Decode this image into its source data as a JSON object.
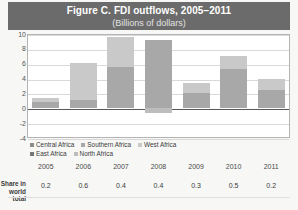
{
  "title": {
    "main": "Figure C. FDI outflows, 2005–2011",
    "sub": "(Billions of dollars)"
  },
  "colors": {
    "band": "#6b6b6b",
    "central_africa": "#8c8c8c",
    "southern_africa": "#a8a8a8",
    "west_africa": "#c9c9c9",
    "east_africa": "#767676",
    "north_africa": "#bdbdbd",
    "gridline": "#d9d9d9",
    "zeroline": "#5a5a5a",
    "plot_background": "#ffffff",
    "page_background": "#f7f7f5"
  },
  "legend": {
    "position": "below-plot",
    "rows": [
      [
        "Central Africa",
        "Southern Africa",
        "West Africa"
      ],
      [
        "East Africa",
        "North Africa"
      ]
    ],
    "entries": [
      {
        "label": "Central Africa",
        "color": "#8c8c8c"
      },
      {
        "label": "Southern Africa",
        "color": "#a8a8a8"
      },
      {
        "label": "West Africa",
        "color": "#c9c9c9"
      },
      {
        "label": "East Africa",
        "color": "#767676"
      },
      {
        "label": "North Africa",
        "color": "#bdbdbd"
      }
    ]
  },
  "share_row": {
    "label_line1": "Share in",
    "label_line2": "world total",
    "values": [
      "0.2",
      "0.6",
      "0.4",
      "0.4",
      "0.3",
      "0.5",
      "0.2"
    ]
  },
  "yaxis": {
    "ticks": [
      "10",
      "8",
      "6",
      "4",
      "2",
      "0",
      "-2",
      "-4"
    ],
    "min": -4,
    "max": 10,
    "step": 2
  },
  "chart_data": {
    "type": "bar",
    "title": "Figure C. FDI outflows, 2005–2011",
    "subtitle": "(Billions of dollars)",
    "xlabel": "",
    "ylabel": "Billions of dollars",
    "ylim": [
      -4,
      10
    ],
    "ytick_step": 2,
    "grid": true,
    "stacked": true,
    "legend_position": "below-plot",
    "categories": [
      "2005",
      "2006",
      "2007",
      "2008",
      "2009",
      "2010",
      "2011"
    ],
    "series": [
      {
        "name": "Central Africa",
        "color": "#8c8c8c",
        "values": [
          0.1,
          0.1,
          0.1,
          0.1,
          0.1,
          0.1,
          0.1
        ]
      },
      {
        "name": "Southern Africa",
        "color": "#a8a8a8",
        "values": [
          0.7,
          4.9,
          5.0,
          7.4,
          1.5,
          4.3,
          2.8
        ]
      },
      {
        "name": "West Africa",
        "color": "#c9c9c9",
        "values": [
          0.2,
          0.2,
          4.0,
          0.5,
          0.6,
          2.0,
          0.5
        ]
      },
      {
        "name": "East Africa",
        "color": "#767676",
        "values": [
          0.1,
          0.1,
          0.1,
          0.1,
          0.1,
          0.1,
          0.1
        ]
      },
      {
        "name": "North Africa",
        "color": "#bdbdbd",
        "values": [
          0.3,
          0.8,
          0.4,
          1.1,
          1.1,
          0.6,
          0.4
        ]
      }
    ],
    "totals": [
      1.4,
      6.1,
      9.6,
      9.2,
      3.4,
      7.1,
      3.9
    ],
    "negatives": [
      0.0,
      0.0,
      0.0,
      -0.6,
      0.0,
      0.0,
      0.0
    ],
    "bar_spans": [
      {
        "year": "2005",
        "base": 0,
        "top": 1.4,
        "split": 0.9
      },
      {
        "year": "2006",
        "base": 0,
        "top": 6.1,
        "split": 1.1
      },
      {
        "year": "2007",
        "base": 0,
        "top": 9.6,
        "split": 5.6
      },
      {
        "year": "2008",
        "base": -0.6,
        "top": 9.2,
        "split": 9.2
      },
      {
        "year": "2009",
        "base": 0,
        "top": 3.4,
        "split": 2.1
      },
      {
        "year": "2010",
        "base": 0,
        "top": 7.1,
        "split": 5.3
      },
      {
        "year": "2011",
        "base": 0,
        "top": 3.9,
        "split": 2.4
      }
    ],
    "share_in_world_total": [
      0.2,
      0.6,
      0.4,
      0.4,
      0.3,
      0.5,
      0.2
    ]
  }
}
